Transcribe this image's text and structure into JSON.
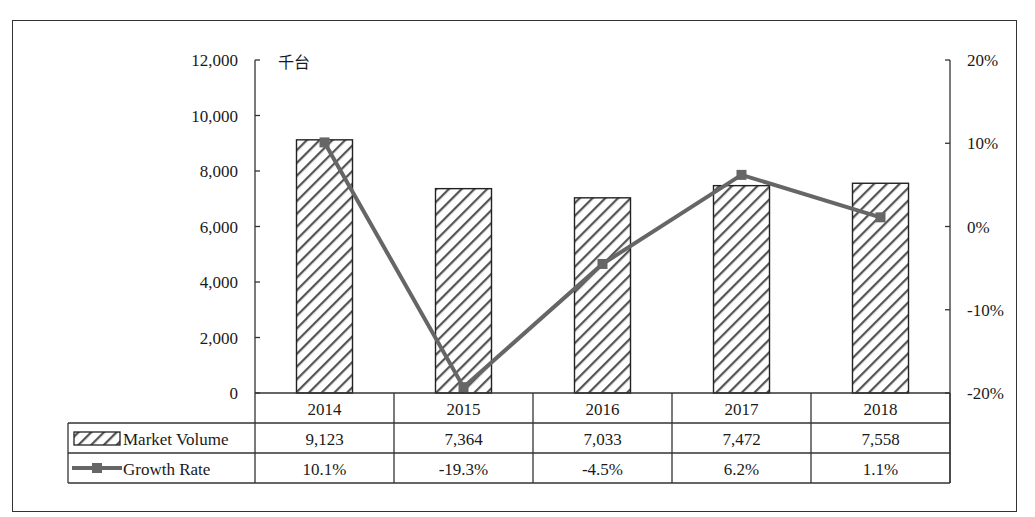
{
  "chart_data": {
    "type": "bar+line",
    "unit_label": "千台",
    "categories": [
      "2014",
      "2015",
      "2016",
      "2017",
      "2018"
    ],
    "series": [
      {
        "name": "Market Volume",
        "type": "bar",
        "axis": "left",
        "pattern": "diagonal-hatch",
        "values": [
          9123,
          7364,
          7033,
          7472,
          7558
        ],
        "labels": [
          "9,123",
          "7,364",
          "7,033",
          "7,472",
          "7,558"
        ]
      },
      {
        "name": "Growth Rate",
        "type": "line",
        "axis": "right",
        "marker": "square",
        "color": "#666666",
        "values": [
          10.1,
          -19.3,
          -4.5,
          6.2,
          1.1
        ],
        "labels": [
          "10.1%",
          "-19.3%",
          "-4.5%",
          "6.2%",
          "1.1%"
        ]
      }
    ],
    "left_axis": {
      "ylim": [
        0,
        12000
      ],
      "ticks": [
        "0",
        "2,000",
        "4,000",
        "6,000",
        "8,000",
        "10,000",
        "12,000"
      ]
    },
    "right_axis": {
      "ylim": [
        -20,
        20
      ],
      "ticks": [
        "-20%",
        "-10%",
        "0%",
        "10%",
        "20%"
      ]
    },
    "grid": false,
    "legend": "data-table"
  }
}
